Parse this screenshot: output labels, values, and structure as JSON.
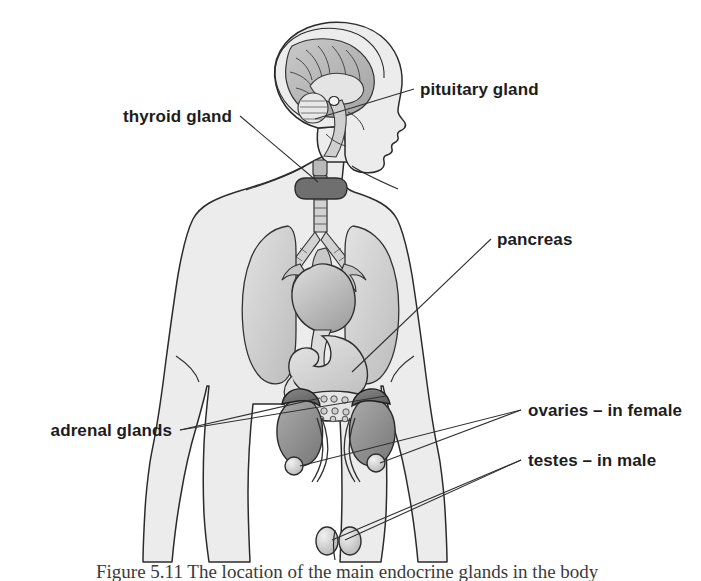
{
  "figure": {
    "title": "The location of the main endocrine glands",
    "caption": "Figure 5.11 The location of the main endocrine glands in the body",
    "view": "anterior whole-body silhouette, head in right profile"
  },
  "colors": {
    "background": "#ffffff",
    "body_fill": "#ececec",
    "body_outline": "#2b2b2b",
    "organ_light": "#d4d4d4",
    "organ_mid": "#b6b6b6",
    "organ_dark": "#8d8d8d",
    "organ_darker": "#6f6f6f",
    "label_text": "#1d1d1d",
    "leader_line": "#303030"
  },
  "labels": [
    {
      "id": "pituitary",
      "text": "pituitary gland",
      "x": 420,
      "y": 95,
      "anchor": "start",
      "side": "right",
      "organ": "pituitary gland",
      "leaders": [
        [
          414,
          89,
          315,
          119
        ]
      ]
    },
    {
      "id": "thyroid",
      "text": "thyroid gland",
      "x": 232,
      "y": 122,
      "anchor": "end",
      "side": "left",
      "organ": "thyroid gland",
      "leaders": [
        [
          240,
          116,
          318,
          182
        ]
      ]
    },
    {
      "id": "pancreas",
      "text": "pancreas",
      "x": 497,
      "y": 245,
      "anchor": "start",
      "side": "right",
      "organ": "pancreas",
      "leaders": [
        [
          491,
          239,
          352,
          372
        ]
      ]
    },
    {
      "id": "adrenal",
      "text": "adrenal glands",
      "x": 172,
      "y": 436,
      "anchor": "end",
      "side": "left",
      "organ": "adrenal glands",
      "leaders": [
        [
          180,
          430,
          320,
          398
        ],
        [
          180,
          430,
          386,
          396
        ]
      ]
    },
    {
      "id": "ovaries",
      "text": "ovaries – in female",
      "x": 528,
      "y": 416,
      "anchor": "start",
      "side": "right",
      "organ": "ovaries",
      "leaders": [
        [
          521,
          410,
          300,
          466
        ],
        [
          521,
          410,
          380,
          463
        ]
      ]
    },
    {
      "id": "testes",
      "text": "testes – in male",
      "x": 528,
      "y": 466,
      "anchor": "start",
      "side": "right",
      "organ": "testes",
      "leaders": [
        [
          521,
          460,
          332,
          540
        ],
        [
          521,
          460,
          345,
          540
        ]
      ]
    }
  ],
  "organs": [
    {
      "name": "brain",
      "note": "sagittal section in head: cerebrum, cerebellum, brainstem"
    },
    {
      "name": "pituitary gland",
      "note": "small gland at base of brain"
    },
    {
      "name": "thyroid gland",
      "note": "butterfly-shaped gland on trachea"
    },
    {
      "name": "trachea",
      "note": "windpipe branching into bronchi"
    },
    {
      "name": "lungs",
      "note": "left and right lungs"
    },
    {
      "name": "heart",
      "note": "central chest, great vessels"
    },
    {
      "name": "oesophagus",
      "note": "tube from heart to stomach"
    },
    {
      "name": "stomach",
      "note": "upper abdomen"
    },
    {
      "name": "pancreas",
      "note": "lobular gland below stomach"
    },
    {
      "name": "kidneys",
      "note": "pair of bean-shaped organs"
    },
    {
      "name": "adrenal glands",
      "note": "caps on top of each kidney"
    },
    {
      "name": "ureters",
      "note": "tubes from kidneys"
    },
    {
      "name": "ovaries",
      "note": "pair of small round glands, female"
    },
    {
      "name": "testes",
      "note": "pair of oval glands, male"
    }
  ]
}
